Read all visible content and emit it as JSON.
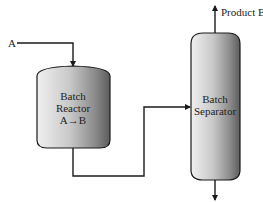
{
  "diagram": {
    "type": "process-flow",
    "feed": {
      "label": "A"
    },
    "reactor": {
      "line1": "Batch",
      "line2": "Reactor",
      "reaction": "A→B"
    },
    "separator": {
      "line1": "Batch",
      "line2": "Separator"
    },
    "top_product": {
      "label": "Product B"
    },
    "colors": {
      "line": "#1a1a1a",
      "vessel_light": "#e6e6e6",
      "vessel_dark": "#6e6e6e",
      "background": "#ffffff"
    }
  }
}
